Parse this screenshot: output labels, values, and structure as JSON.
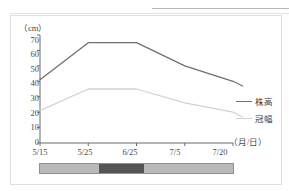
{
  "page": {
    "ghost_text_top": "",
    "background": "#ffffff"
  },
  "figure": {
    "y_unit_label": "（cm）",
    "x_unit_label": "（月/日）"
  },
  "legend": {
    "entries": [
      {
        "label": "株高",
        "color": "#6f6f6f"
      },
      {
        "label": "冠幅",
        "color": "#d2d2d2"
      }
    ]
  },
  "colorbar": {
    "name": "stage-color-bar",
    "segments": [
      {
        "color": "#b9b9b9",
        "width_pct": 30.8
      },
      {
        "color": "#555555",
        "width_pct": 23.1
      },
      {
        "color": "#b9b9b9",
        "width_pct": 46.1
      }
    ],
    "border_color": "#8f8f8f"
  },
  "chart_data": {
    "type": "line",
    "title": "",
    "xlabel": "（月/日）",
    "ylabel": "（cm）",
    "x": [
      "5/15",
      "5/25",
      "6/25",
      "7/5",
      "7/20"
    ],
    "categories": [
      "5/15",
      "5/25",
      "6/25",
      "7/5",
      "7/20"
    ],
    "ylim": [
      0,
      70
    ],
    "yticks": [
      0,
      10,
      20,
      30,
      40,
      50,
      60,
      70
    ],
    "xticks": [
      "5/15",
      "5/25",
      "6/25",
      "7/5",
      "7/20"
    ],
    "grid": false,
    "legend_position": "right",
    "series": [
      {
        "name": "株高",
        "color": "#6f6f6f",
        "values": [
          41,
          65,
          65,
          50,
          40
        ]
      },
      {
        "name": "冠幅",
        "color": "#d2d2d2",
        "values": [
          21,
          35,
          35,
          26,
          20
        ]
      }
    ]
  }
}
